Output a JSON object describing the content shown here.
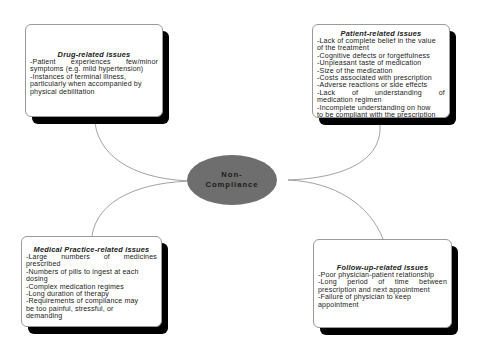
{
  "center": {
    "line1": "Non-",
    "line2": "Compliance",
    "fill": "#6e6e6e"
  },
  "nodes": {
    "drug": {
      "title": "Drug-related issues",
      "items": [
        "-Patient experiences few/minor",
        "symptoms (e.g. mild hypertension)",
        "-Instances of terminal illness,",
        "particularly when accompanied by",
        "physical debilitation"
      ]
    },
    "patient": {
      "title": "Patient-related issues",
      "items": [
        "-Lack of complete belief in the value",
        "of the treatment",
        "-Cognitive defects or forgetfulness",
        "-Unpleasant taste of medication",
        "-Size of the medication",
        "-Costs associated with prescription",
        "-Adverse reactions or side effects",
        "-Lack of understanding of",
        "medication regimen",
        "-Incomplete understanding on how",
        "to be compliant with the prescription"
      ]
    },
    "medical": {
      "title": "Medical Practice-related issues",
      "items": [
        "-Large numbers of medicines",
        "prescribed",
        "-Numbers of pills to ingest at each",
        "dosing",
        "-Complex medication regimes",
        "-Long duration of therapy",
        "-Requirements of compliance may",
        "be too painful, stressful, or",
        "demanding"
      ]
    },
    "followup": {
      "title": "Follow-up-related issues",
      "items": [
        "-Poor physician-patient relationship",
        "-Long period of time between",
        "prescription and next appointment",
        "-Failure of physician to keep",
        "appointment"
      ]
    }
  },
  "colors": {
    "shadow": "#000000",
    "box_border": "#9a9a9a",
    "connector": "#8a8a8a",
    "ellipse": "#6e6e6e"
  }
}
